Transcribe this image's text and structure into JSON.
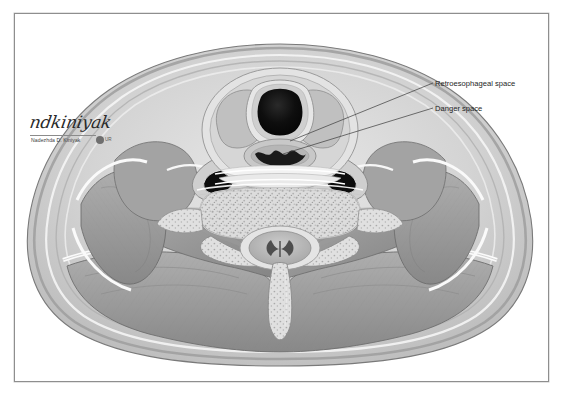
{
  "figure": {
    "title": "Posterior Cervical Space of the Neck at C7",
    "modality": "grayscale anatomical cross-section illustration",
    "orientation": "axial",
    "level": "C7",
    "frame_color": "#8e8e8e",
    "background_color": "#ffffff"
  },
  "annotations": [
    {
      "id": "retroesophageal-space",
      "label": "Retroesophageal space",
      "leader_from": [
        433,
        83
      ],
      "leader_to": [
        289,
        140
      ]
    },
    {
      "id": "danger-space",
      "label": "Danger space",
      "leader_from": [
        433,
        108
      ],
      "leader_to": [
        283,
        151
      ]
    }
  ],
  "signature": {
    "script": "ndkiniyak",
    "name": "Nadezhda D. Kiniyak",
    "badge_text": "UR"
  },
  "structures": [
    {
      "name": "trachea",
      "tone": "#141414"
    },
    {
      "name": "tracheal-cartilage",
      "tone": "#d8d8d8"
    },
    {
      "name": "esophagus",
      "tone": "#b9b9b9"
    },
    {
      "name": "thyroid-gland",
      "tone": "#c2c2c2"
    },
    {
      "name": "common-carotid-artery",
      "tone": "#101010"
    },
    {
      "name": "internal-jugular-vein",
      "tone": "#101010"
    },
    {
      "name": "vertebral-body-c7",
      "tone": "#cfcfcf"
    },
    {
      "name": "spinal-cord",
      "tone": "#b4b4b4"
    },
    {
      "name": "gray-matter",
      "tone": "#4a4a4a"
    },
    {
      "name": "spinous-process",
      "tone": "#d2d2d2"
    },
    {
      "name": "sternocleidomastoid-muscle",
      "tone": "#9a9a9a"
    },
    {
      "name": "trapezius-muscle",
      "tone": "#8f8f8f"
    },
    {
      "name": "paraspinal-muscles",
      "tone": "#949494"
    },
    {
      "name": "deep-cervical-fascia",
      "tone": "#fdfdfd"
    },
    {
      "name": "subcutaneous-fat",
      "tone": "#cdcdcd"
    },
    {
      "name": "skin",
      "tone": "#a8a8a8"
    }
  ]
}
